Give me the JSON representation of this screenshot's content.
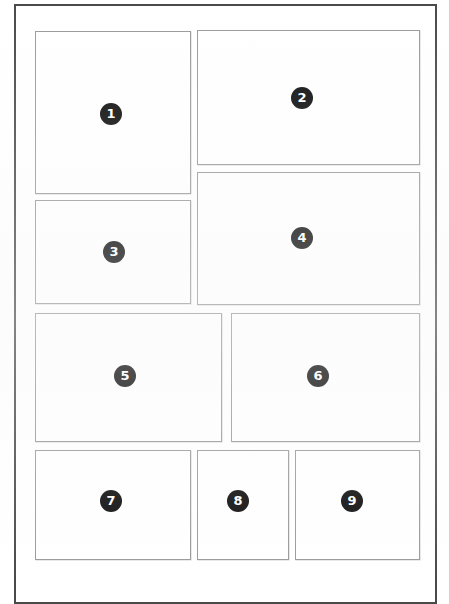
{
  "page": {
    "background_color": "#ffffff",
    "frame_border_color": "#4a4a4a",
    "box_border_color": "#9a9a9a",
    "badge_color": "#0d0d0d",
    "badge_text_color": "#ffffff"
  },
  "frame": {
    "label": "page-frame"
  },
  "boxes": [
    {
      "id": "box-1",
      "number": "1",
      "x": 35,
      "y": 31,
      "width": 156,
      "height": 163,
      "badge_x": 100,
      "badge_y": 103
    },
    {
      "id": "box-2",
      "number": "2",
      "x": 197,
      "y": 30,
      "width": 223,
      "height": 135,
      "badge_x": 291,
      "badge_y": 87
    },
    {
      "id": "box-3",
      "number": "3",
      "x": 35,
      "y": 200,
      "width": 156,
      "height": 104,
      "badge_x": 103,
      "badge_y": 241
    },
    {
      "id": "box-4",
      "number": "4",
      "x": 197,
      "y": 172,
      "width": 223,
      "height": 133,
      "badge_x": 291,
      "badge_y": 227
    },
    {
      "id": "box-5",
      "number": "5",
      "x": 35,
      "y": 313,
      "width": 187,
      "height": 129,
      "badge_x": 114,
      "badge_y": 365
    },
    {
      "id": "box-6",
      "number": "6",
      "x": 231,
      "y": 313,
      "width": 189,
      "height": 129,
      "badge_x": 307,
      "badge_y": 365
    },
    {
      "id": "box-7",
      "number": "7",
      "x": 35,
      "y": 450,
      "width": 156,
      "height": 110,
      "badge_x": 100,
      "badge_y": 490
    },
    {
      "id": "box-8",
      "number": "8",
      "x": 197,
      "y": 450,
      "width": 92,
      "height": 110,
      "badge_x": 227,
      "badge_y": 490
    },
    {
      "id": "box-9",
      "number": "9",
      "x": 295,
      "y": 450,
      "width": 125,
      "height": 110,
      "badge_x": 341,
      "badge_y": 490
    }
  ]
}
